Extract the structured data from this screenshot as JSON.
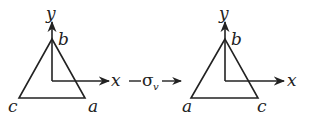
{
  "diagram": {
    "operation": {
      "symbol": "σ",
      "subscript": "v",
      "arrow": "→"
    },
    "left_figure": {
      "axes": {
        "x_label": "x",
        "y_label": "y"
      },
      "vertices": {
        "top": "b",
        "bottom_left": "c",
        "bottom_right": "a"
      }
    },
    "right_figure": {
      "axes": {
        "x_label": "x",
        "y_label": "y"
      },
      "vertices": {
        "top": "b",
        "bottom_left": "a",
        "bottom_right": "c"
      }
    },
    "colors": {
      "stroke": "#222222",
      "background": "#ffffff"
    }
  }
}
